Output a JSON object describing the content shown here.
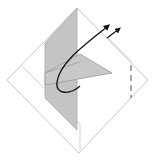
{
  "diagram": {
    "title": "Origami fold step",
    "colors": {
      "background": "#ffffff",
      "paper_outline": "#c8c8c8",
      "flap_fill": "#c4c4c4",
      "flap_edge": "#9a9a9a",
      "arrow": "#111111",
      "fold_line": "#555555"
    },
    "shapes": {
      "outer_square": "diamond",
      "inner_edge": "offset outline",
      "vertical_flap": "shaded quadrilateral",
      "triangle_flap": "shaded triangle",
      "fold_arrow": "curved arrow",
      "secondary_arrow": "short straight arrow",
      "valley_fold": "dashed vertical line"
    }
  }
}
